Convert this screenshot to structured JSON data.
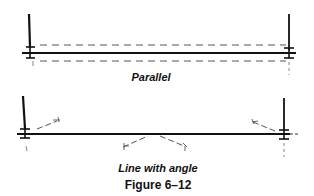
{
  "figure": {
    "caption": "Figure 6–12",
    "panels": [
      {
        "id": "parallel",
        "label": "Parallel"
      },
      {
        "id": "line-with-angle",
        "label": "Line with angle"
      }
    ]
  },
  "colors": {
    "stroke": "#111111",
    "dashed": "#555555",
    "background": "#ffffff"
  }
}
